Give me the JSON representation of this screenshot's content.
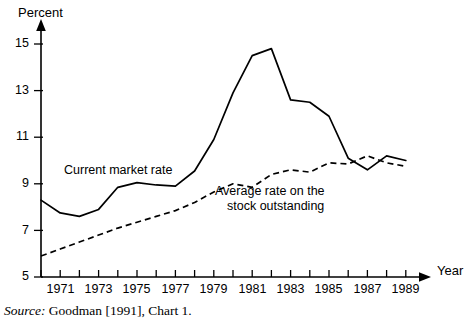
{
  "chart_data": {
    "type": "line",
    "title": "",
    "xlabel": "Year",
    "ylabel": "Percent",
    "xlim": [
      1970,
      1989.9
    ],
    "ylim": [
      5,
      15.6
    ],
    "grid": false,
    "legend_position": "inline-annotations",
    "y_ticks": [
      5,
      7,
      9,
      11,
      13,
      15
    ],
    "y_tick_labels": [
      "5",
      "7",
      "9",
      "11",
      "13",
      "15"
    ],
    "x_ticks": [
      1970,
      1971,
      1972,
      1973,
      1974,
      1975,
      1976,
      1977,
      1978,
      1979,
      1980,
      1981,
      1982,
      1983,
      1984,
      1985,
      1986,
      1987,
      1988,
      1989
    ],
    "x_tick_labels": [
      "",
      "1971",
      "",
      "1973",
      "",
      "1975",
      "",
      "1977",
      "",
      "1979",
      "",
      "1981",
      "",
      "1983",
      "",
      "1985",
      "",
      "1987",
      "",
      "1989"
    ],
    "x": [
      1970,
      1971,
      1972,
      1973,
      1974,
      1975,
      1976,
      1977,
      1978,
      1979,
      1980,
      1981,
      1982,
      1983,
      1984,
      1985,
      1986,
      1987,
      1988,
      1989
    ],
    "series": [
      {
        "name": "Current market rate",
        "style": "solid",
        "color": "#000000",
        "values": [
          8.3,
          7.75,
          7.6,
          7.9,
          8.85,
          9.05,
          8.95,
          8.9,
          9.55,
          10.9,
          12.9,
          14.5,
          14.8,
          12.6,
          12.5,
          11.9,
          10.1,
          9.6,
          10.2,
          10.0
        ]
      },
      {
        "name": "Average rate on the stock outstanding",
        "style": "dashed",
        "color": "#000000",
        "values": [
          5.9,
          6.2,
          6.5,
          6.8,
          7.1,
          7.35,
          7.6,
          7.85,
          8.2,
          8.65,
          9.0,
          8.85,
          9.4,
          9.6,
          9.5,
          9.9,
          9.85,
          10.2,
          9.9,
          9.75
        ]
      }
    ],
    "annotations": [
      {
        "text": "Current market rate",
        "x": 1973.4,
        "y": 10.05
      },
      {
        "text_line1": "Average rate on the",
        "text_line2": "stock outstanding",
        "x": 1981.2,
        "y": 8.9
      }
    ]
  },
  "labels": {
    "y_axis_title": "Percent",
    "x_axis_title": "Year",
    "annotation_current_market_rate": "Current market rate",
    "annotation_average_rate_line1": "Average rate on the",
    "annotation_average_rate_line2": "stock outstanding"
  },
  "source": {
    "prefix": "Source:",
    "text": " Goodman [1991], Chart 1."
  }
}
